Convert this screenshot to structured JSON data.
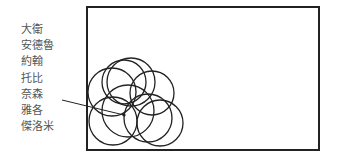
{
  "labels": [
    "大衛",
    "安德魯",
    "約翰",
    "托比",
    "奈森",
    "雅各",
    "傑洛米"
  ],
  "colors": {
    "stroke": "#222222",
    "label": "#555555",
    "background": "#ffffff"
  },
  "frame": {
    "x": 87,
    "y": 7,
    "width": 232,
    "height": 143
  },
  "pointer": {
    "x1": 62,
    "y1": 100,
    "x2": 124,
    "y2": 115
  },
  "circles": [
    {
      "cx": 112,
      "cy": 92,
      "r": 24
    },
    {
      "cx": 124,
      "cy": 82,
      "r": 22
    },
    {
      "cx": 131,
      "cy": 82,
      "r": 24
    },
    {
      "cx": 152,
      "cy": 93,
      "r": 22
    },
    {
      "cx": 113,
      "cy": 121,
      "r": 24
    },
    {
      "cx": 128,
      "cy": 111,
      "r": 26
    },
    {
      "cx": 148,
      "cy": 118,
      "r": 24
    },
    {
      "cx": 160,
      "cy": 123,
      "r": 23
    }
  ]
}
